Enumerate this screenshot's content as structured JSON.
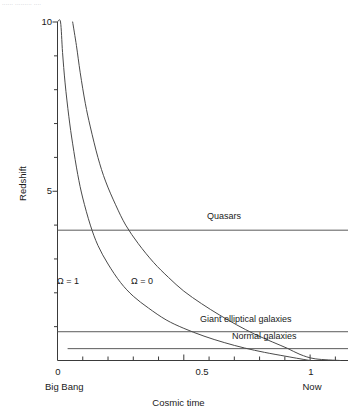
{
  "caption_fragment": "......  .........  ....",
  "chart_data": {
    "type": "line",
    "title": "",
    "xlabel": "Cosmic time",
    "ylabel": "Redshift",
    "xlim": [
      0,
      1.15
    ],
    "ylim": [
      0,
      10
    ],
    "grid": false,
    "legend": "inline-annotations",
    "x_ticks": [
      {
        "value": 0,
        "label": "0",
        "sublabel": "Big Bang",
        "major": true
      },
      {
        "value": 0.5,
        "label": "0.5",
        "sublabel": "",
        "major": true
      },
      {
        "value": 1,
        "label": "1",
        "sublabel": "Now",
        "major": true
      }
    ],
    "x_minor_ticks": [
      0.1,
      0.2,
      0.3,
      0.4,
      0.6,
      0.7,
      0.8,
      0.9,
      1.1
    ],
    "y_ticks": [
      {
        "value": 10,
        "label": "10"
      },
      {
        "value": 5,
        "label": "5"
      }
    ],
    "y_minor_ticks": [
      1,
      2,
      3,
      4,
      6,
      7,
      8,
      9
    ],
    "series": [
      {
        "name": "Omega = 1",
        "label": "Ω = 1",
        "label_x": 0.13,
        "label_y": 2.35,
        "points": [
          [
            0.0,
            10.0
          ],
          [
            0.012,
            10.0
          ],
          [
            0.02,
            9.1
          ],
          [
            0.03,
            8.2
          ],
          [
            0.045,
            7.2
          ],
          [
            0.06,
            6.4
          ],
          [
            0.08,
            5.5
          ],
          [
            0.1,
            4.8
          ],
          [
            0.13,
            4.0
          ],
          [
            0.16,
            3.4
          ],
          [
            0.2,
            2.85
          ],
          [
            0.25,
            2.3
          ],
          [
            0.3,
            1.9
          ],
          [
            0.36,
            1.55
          ],
          [
            0.43,
            1.2
          ],
          [
            0.5,
            0.95
          ],
          [
            0.58,
            0.72
          ],
          [
            0.66,
            0.53
          ],
          [
            0.74,
            0.37
          ],
          [
            0.82,
            0.24
          ],
          [
            0.9,
            0.13
          ],
          [
            0.96,
            0.05
          ],
          [
            1.0,
            0.0
          ]
        ]
      },
      {
        "name": "Omega = 0",
        "label": "Ω = 0",
        "label_x": 0.36,
        "label_y": 2.35,
        "points": [
          [
            0.06,
            10.0
          ],
          [
            0.075,
            9.3
          ],
          [
            0.09,
            8.5
          ],
          [
            0.11,
            7.6
          ],
          [
            0.13,
            6.9
          ],
          [
            0.16,
            6.0
          ],
          [
            0.19,
            5.3
          ],
          [
            0.23,
            4.6
          ],
          [
            0.27,
            4.0
          ],
          [
            0.32,
            3.45
          ],
          [
            0.38,
            2.9
          ],
          [
            0.44,
            2.45
          ],
          [
            0.5,
            2.05
          ],
          [
            0.57,
            1.68
          ],
          [
            0.64,
            1.35
          ],
          [
            0.71,
            1.05
          ],
          [
            0.78,
            0.78
          ],
          [
            0.85,
            0.55
          ],
          [
            0.91,
            0.36
          ],
          [
            0.96,
            0.18
          ],
          [
            1.02,
            0.05
          ],
          [
            1.12,
            0.0
          ]
        ]
      }
    ],
    "annotation_lines": [
      {
        "name": "quasars",
        "label": "Quasars",
        "redshift": 3.85,
        "x_start": 0.0,
        "x_end": 1.15,
        "label_x": 0.52,
        "label_above": true
      },
      {
        "name": "giant-elliptical-galaxies",
        "label": "Giant elliptical galaxies",
        "redshift": 0.85,
        "x_start": 0.0,
        "x_end": 1.15,
        "label_x": 0.6,
        "label_above": true
      },
      {
        "name": "normal-galaxies",
        "label": "Normal galaxies",
        "redshift": 0.35,
        "x_start": 0.04,
        "x_end": 1.15,
        "label_x": 0.66,
        "label_above": true
      }
    ]
  },
  "axes": {
    "y_title": "Redshift",
    "x_title": "Cosmic time",
    "y_tick_10": "10",
    "y_tick_5": "5",
    "x_tick_0": "0",
    "x_tick_05": "0.5",
    "x_tick_1": "1",
    "x_sub_0": "Big Bang",
    "x_sub_1": "Now"
  },
  "labels": {
    "omega_one": "Ω = 1",
    "omega_zero": "Ω = 0",
    "quasars": "Quasars",
    "giant_elliptical": "Giant elliptical galaxies",
    "normal_galaxies": "Normal galaxies"
  },
  "colors": {
    "background": "#ffffff",
    "axis": "#3a3a3a",
    "curve": "#4a4a4a",
    "annotation_line": "#5a5a5a",
    "text": "#1a1a1a",
    "caption": "#b9b9bf"
  }
}
